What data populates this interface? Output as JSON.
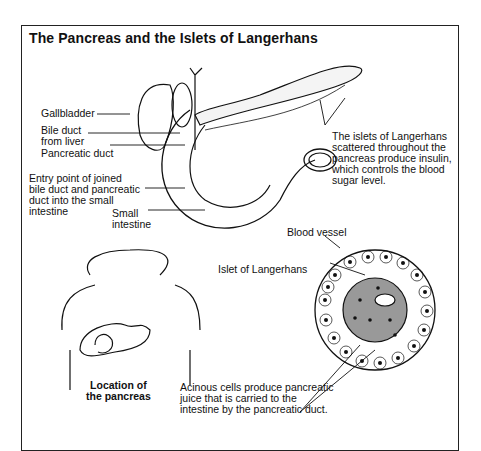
{
  "title": "The Pancreas and the Islets of Langerhans",
  "labels": {
    "gallbladder": "Gallbladder",
    "bile_duct_1": "Bile duct",
    "bile_duct_2": "from liver",
    "pancreatic_duct": "Pancreatic duct",
    "entry_1": "Entry point of joined",
    "entry_2": "bile duct and pancreatic",
    "entry_3": "duct into the small",
    "entry_4": "intestine",
    "small_int_1": "Small",
    "small_int_2": "intestine",
    "islets_1": "The islets of Langerhans",
    "islets_2": "scattered throughout the",
    "islets_3": "pancreas produce insulin,",
    "islets_4": "which controls the blood",
    "islets_5": "sugar level.",
    "blood_vessel": "Blood vessel",
    "islet": "Islet of Langerhans",
    "location_1": "Location of",
    "location_2": "the pancreas",
    "acinous_1": "Acinous cells produce pancreatic",
    "acinous_2": "juice that is carried to the",
    "acinous_3": "intestine by  the pancreatic duct."
  }
}
